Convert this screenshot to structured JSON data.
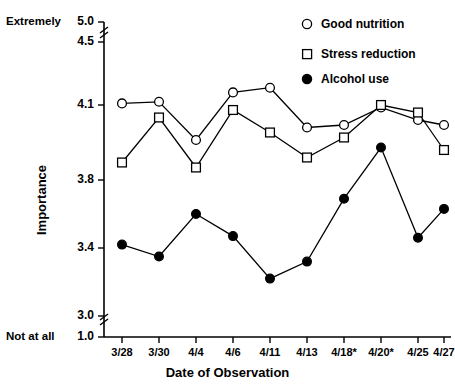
{
  "chart_data": {
    "type": "line",
    "title": "",
    "xlabel": "Date of Observation",
    "ylabel": "Importance",
    "categories": [
      "3/28",
      "3/30",
      "4/4",
      "4/6",
      "4/11",
      "4/13",
      "4/18*",
      "4/20*",
      "4/25",
      "4/27"
    ],
    "series": [
      {
        "name": "Good nutrition",
        "marker": "open-circle",
        "values": [
          4.11,
          4.12,
          3.96,
          4.18,
          4.21,
          4.01,
          4.02,
          4.09,
          4.04,
          4.02
        ]
      },
      {
        "name": "Stress reduction",
        "marker": "open-square",
        "values": [
          3.87,
          4.05,
          3.85,
          4.08,
          3.99,
          3.89,
          3.97,
          4.1,
          4.07,
          3.92
        ]
      },
      {
        "name": "Alcohol use",
        "marker": "filled-circle",
        "values": [
          3.42,
          3.35,
          3.6,
          3.47,
          3.22,
          3.32,
          3.69,
          3.93,
          3.46,
          3.63
        ]
      }
    ],
    "ytick_labels": [
      "5.0",
      "4.5",
      "4.1",
      "3.8",
      "3.4",
      "3.0",
      "1.0"
    ],
    "ytick_values": [
      5.0,
      4.5,
      4.1,
      3.8,
      3.4,
      3.0,
      1.0
    ],
    "ylim": [
      3.0,
      4.5
    ],
    "axis_breaks": [
      "between 4.5 and 5.0",
      "between 1.0 and 3.0"
    ],
    "grid": false,
    "legend_position": "top-right",
    "scale_anchor_high": "Extremely",
    "scale_anchor_low": "Not at all"
  },
  "axis": {
    "y_title": "Importance",
    "x_title": "Date of Observation",
    "anchor_top": "Extremely",
    "anchor_bottom": "Not at all"
  },
  "legend": {
    "items": [
      {
        "label": "Good nutrition",
        "marker": "open-circle"
      },
      {
        "label": "Stress reduction",
        "marker": "open-square"
      },
      {
        "label": "Alcohol use",
        "marker": "filled-circle"
      }
    ]
  },
  "colors": {
    "ink": "#000000",
    "background": "#ffffff",
    "axis": "#1a1a1a"
  }
}
